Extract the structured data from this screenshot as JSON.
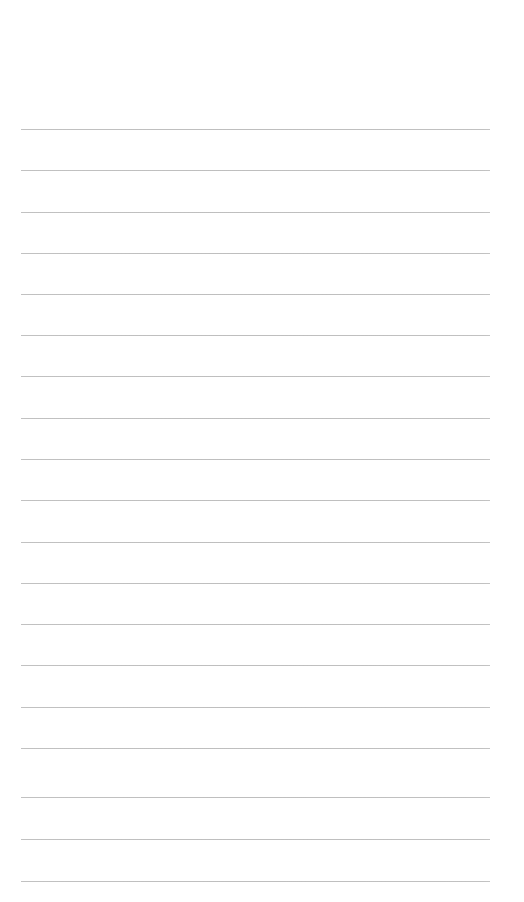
{
  "page": {
    "kind": "lined-paper",
    "width": 524,
    "height": 902,
    "background_color": "#ffffff",
    "content_text": "",
    "is_blank": "true"
  },
  "rules": {
    "count": 19,
    "color": "#bebebe",
    "thickness_px": 1,
    "spacing_px": 41,
    "left_x": 21,
    "right_x": 490,
    "first_line_y": 129,
    "last_line_y": 881,
    "lines": [
      {
        "index": "1",
        "y": 129,
        "text": ""
      },
      {
        "index": "2",
        "y": 170,
        "text": ""
      },
      {
        "index": "3",
        "y": 212,
        "text": ""
      },
      {
        "index": "4",
        "y": 253,
        "text": ""
      },
      {
        "index": "5",
        "y": 294,
        "text": ""
      },
      {
        "index": "6",
        "y": 335,
        "text": ""
      },
      {
        "index": "7",
        "y": 376,
        "text": ""
      },
      {
        "index": "8",
        "y": 418,
        "text": ""
      },
      {
        "index": "9",
        "y": 459,
        "text": ""
      },
      {
        "index": "10",
        "y": 500,
        "text": ""
      },
      {
        "index": "11",
        "y": 542,
        "text": ""
      },
      {
        "index": "12",
        "y": 583,
        "text": ""
      },
      {
        "index": "13",
        "y": 624,
        "text": ""
      },
      {
        "index": "14",
        "y": 665,
        "text": ""
      },
      {
        "index": "15",
        "y": 707,
        "text": ""
      },
      {
        "index": "16",
        "y": 748,
        "text": ""
      },
      {
        "index": "17",
        "y": 797,
        "text": ""
      },
      {
        "index": "18",
        "y": 839,
        "text": ""
      },
      {
        "index": "19",
        "y": 881,
        "text": ""
      }
    ]
  },
  "margins": {
    "top_blank_height": 128,
    "bottom_blank_height": 20
  }
}
